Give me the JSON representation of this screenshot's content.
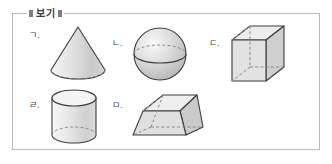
{
  "box": {
    "caption": "보기",
    "border_color": "#b9b9b9",
    "background": "#ffffff"
  },
  "items": [
    {
      "label": "ㄱ.",
      "shape": "cone",
      "shape_name": "cone-figure",
      "hidden_edge_style": "dashed"
    },
    {
      "label": "ㄴ.",
      "shape": "sphere",
      "shape_name": "sphere-figure",
      "hidden_edge_style": "dashed"
    },
    {
      "label": "ㄷ.",
      "shape": "rectangular-prism",
      "shape_name": "cuboid-figure",
      "hidden_edge_style": "dashed"
    },
    {
      "label": "ㄹ.",
      "shape": "cylinder",
      "shape_name": "cylinder-figure",
      "hidden_edge_style": "dashed"
    },
    {
      "label": "ㅁ.",
      "shape": "truncated-pyramid",
      "shape_name": "frustum-figure",
      "hidden_edge_style": "dashed"
    }
  ],
  "colors": {
    "outline": "#3c3c3c",
    "hidden_edge": "#8a8a8a",
    "fill_light": "#f2f2f2",
    "fill_mid": "#dcdcdc",
    "fill_dark": "#c4c4c4",
    "label_text": "#404040",
    "caption_text": "#3a3a3a",
    "tick": "#7d7d7d"
  }
}
